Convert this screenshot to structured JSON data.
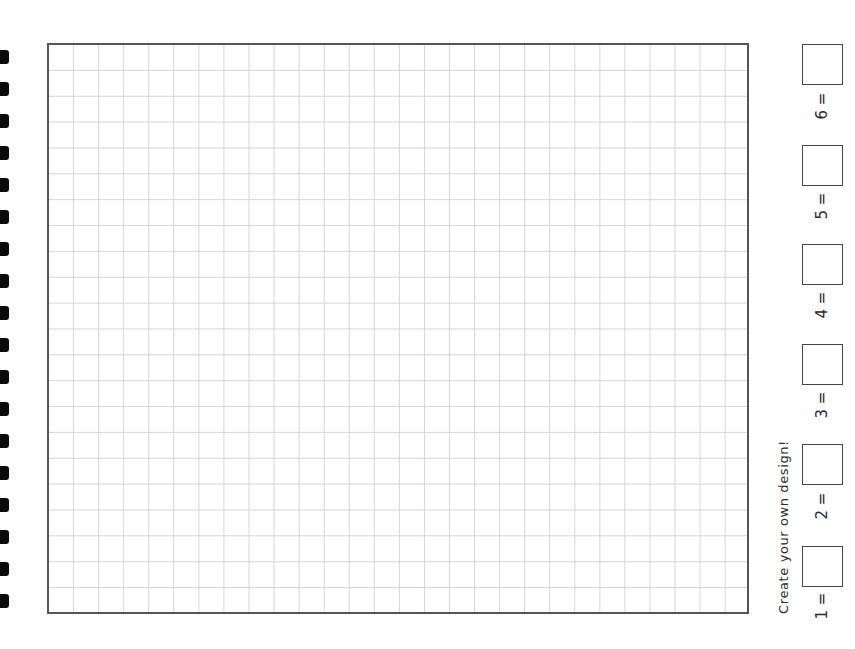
{
  "page": {
    "title": "Create your own design!",
    "grid": {
      "columns": 28,
      "rows": 22,
      "border_color": "#555555",
      "line_color": "#d4d4d4"
    },
    "binding_holes": {
      "count": 18,
      "color": "#0a0a0a"
    },
    "color_key": [
      {
        "number": "1",
        "label": "1 =",
        "value": ""
      },
      {
        "number": "2",
        "label": "2 =",
        "value": ""
      },
      {
        "number": "3",
        "label": "3 =",
        "value": ""
      },
      {
        "number": "4",
        "label": "4 =",
        "value": ""
      },
      {
        "number": "5",
        "label": "5 =",
        "value": ""
      },
      {
        "number": "6",
        "label": "6 =",
        "value": ""
      }
    ]
  }
}
